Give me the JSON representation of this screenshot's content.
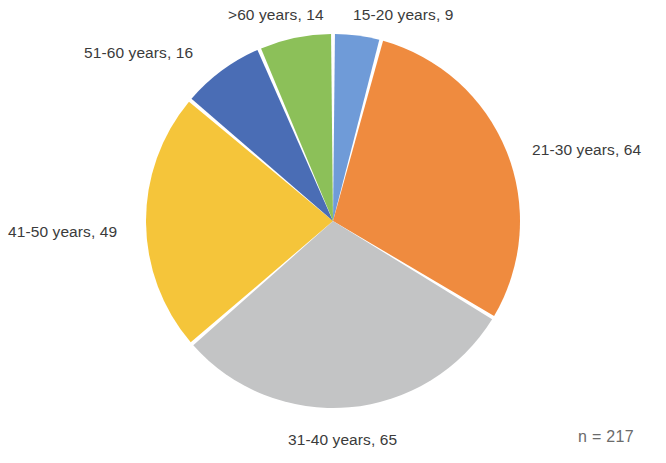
{
  "chart_data": {
    "type": "pie",
    "title": "",
    "subtitle": "",
    "xlabel": "",
    "ylabel": "",
    "legend_position": "none",
    "grid": false,
    "total": 217,
    "total_label": "n = 217",
    "units": "patients",
    "categories": [
      "15-20 years",
      "21-30 years",
      "31-40 years",
      "41-50 years",
      "51-60 years",
      ">60 years"
    ],
    "values": [
      9,
      64,
      65,
      49,
      16,
      14
    ],
    "colors": [
      "#6f9bd8",
      "#ef8b3f",
      "#c3c4c5",
      "#f5c53a",
      "#4a6db5",
      "#8cc059"
    ],
    "labels": [
      "15-20 years, 9",
      "21-30 years, 64",
      "31-40 years, 65",
      "41-50 years, 49",
      "51-60 years, 16",
      ">60 years, 14"
    ],
    "slices": [
      {
        "category": "15-20 years",
        "value": 9,
        "label": "15-20 years, 9",
        "color": "#6f9bd8",
        "percent": 4.1
      },
      {
        "category": "21-30 years",
        "value": 64,
        "label": "21-30 years, 64",
        "color": "#ef8b3f",
        "percent": 29.5
      },
      {
        "category": "31-40 years",
        "value": 65,
        "label": "31-40 years, 65",
        "color": "#c3c4c5",
        "percent": 30.0
      },
      {
        "category": "41-50 years",
        "value": 49,
        "label": "41-50 years, 49",
        "color": "#f5c53a",
        "percent": 22.6
      },
      {
        "category": "51-60 years",
        "value": 16,
        "label": "51-60 years, 16",
        "color": "#4a6db5",
        "percent": 7.4
      },
      {
        "category": ">60 years",
        "value": 14,
        "label": ">60 years, 14",
        "color": "#8cc059",
        "percent": 6.5
      }
    ],
    "start_angle_deg": 0,
    "direction": "clockwise"
  },
  "chart": {
    "labels": {
      "slice0": "15-20 years, 9",
      "slice1": "21-30 years, 64",
      "slice2": "31-40 years, 65",
      "slice3": "41-50 years, 49",
      "slice4": "51-60 years, 16",
      "slice5": ">60 years, 14"
    },
    "total_note": "n = 217"
  }
}
